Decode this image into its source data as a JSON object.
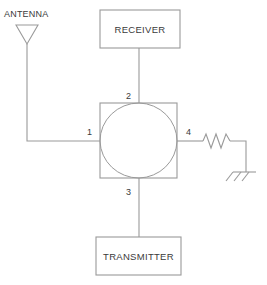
{
  "diagram": {
    "line_color": "#9a9a9a",
    "text_color": "#3a3a3a",
    "background": "#ffffff",
    "blocks": [
      {
        "id": "receiver",
        "label": "RECEIVER"
      },
      {
        "id": "transmitter",
        "label": "TRANSMITTER"
      }
    ],
    "coupler": {
      "name": "hybrid-ring-coupler",
      "shape": "square-with-concave-star"
    },
    "ports": [
      {
        "id": "port-1",
        "label": "1",
        "connects_to": "antenna"
      },
      {
        "id": "port-2",
        "label": "2",
        "connects_to": "receiver"
      },
      {
        "id": "port-3",
        "label": "3",
        "connects_to": "transmitter"
      },
      {
        "id": "port-4",
        "label": "4",
        "connects_to": "resistor"
      }
    ],
    "components": [
      {
        "id": "antenna",
        "label": "ANTENNA",
        "symbol": "antenna-icon"
      },
      {
        "id": "resistor",
        "label": "",
        "symbol": "resistor-icon"
      },
      {
        "id": "ground",
        "label": "",
        "symbol": "ground-icon"
      }
    ]
  }
}
